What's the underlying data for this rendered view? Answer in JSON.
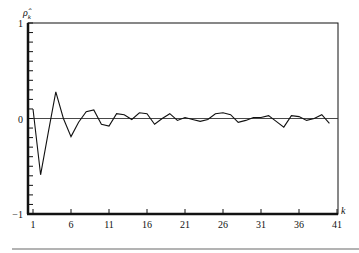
{
  "chart_data": {
    "type": "line",
    "title": "",
    "xlabel": "k",
    "ylabel": "ρ̂k",
    "ylim": [
      -1,
      1
    ],
    "xlim": [
      1,
      41
    ],
    "grid": false,
    "legend": null,
    "zero_line": true,
    "x_ticks": [
      1,
      6,
      11,
      16,
      21,
      26,
      31,
      36,
      41
    ],
    "y_ticks": [
      {
        "value": 1,
        "label": "1"
      },
      {
        "value": 0,
        "label": "0"
      },
      {
        "value": -1,
        "label": "−1"
      }
    ],
    "y_minor_tick_step": 0.1,
    "series": [
      {
        "name": "sample autocorrelation",
        "x": [
          1,
          2,
          3,
          4,
          5,
          6,
          7,
          8,
          9,
          10,
          11,
          12,
          13,
          14,
          15,
          16,
          17,
          18,
          19,
          20,
          21,
          22,
          23,
          24,
          25,
          26,
          27,
          28,
          29,
          30,
          31,
          32,
          33,
          34,
          35,
          36,
          37,
          38,
          39,
          40
        ],
        "values": [
          0.1,
          -0.59,
          -0.15,
          0.28,
          0.0,
          -0.19,
          -0.04,
          0.07,
          0.09,
          -0.06,
          -0.08,
          0.05,
          0.04,
          -0.01,
          0.06,
          0.05,
          -0.06,
          0.0,
          0.05,
          -0.02,
          0.01,
          -0.01,
          -0.03,
          -0.01,
          0.05,
          0.06,
          0.04,
          -0.04,
          -0.02,
          0.01,
          0.01,
          0.03,
          -0.03,
          -0.09,
          0.03,
          0.02,
          -0.02,
          0.0,
          0.04,
          -0.05
        ]
      }
    ]
  },
  "labels": {
    "y_axis": "ρ̂",
    "y_axis_sub": "k",
    "x_axis": "k"
  }
}
